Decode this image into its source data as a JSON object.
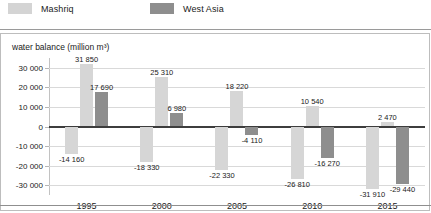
{
  "legend": {
    "items": [
      {
        "label": "Mashriq",
        "color": "#d6d6d6",
        "icon": "legend-swatch-icon"
      },
      {
        "label": "West Asia",
        "color": "#8e8e8e",
        "icon": "legend-swatch-icon"
      }
    ]
  },
  "axis": {
    "y_title": "water balance (million m³)",
    "y_ticks": [
      "30 000",
      "20 000",
      "10 000",
      "0",
      "-10 000",
      "-20 000",
      "-30 000"
    ]
  },
  "chart_data": {
    "type": "bar",
    "title": "",
    "subtitle": "",
    "xlabel": "",
    "ylabel": "water balance (million m³)",
    "ylim": [
      -35000,
      35000
    ],
    "ytick_values": [
      30000,
      20000,
      10000,
      0,
      -10000,
      -20000,
      -30000
    ],
    "grid": true,
    "legend_position": "top-left",
    "categories": [
      "1995",
      "2000",
      "2005",
      "2010",
      "2015"
    ],
    "series": [
      {
        "name": "Mashriq",
        "color": "#d6d6d6",
        "values": [
          -14160,
          -18330,
          -22330,
          -26810,
          -31910
        ],
        "labels": [
          "-14 160",
          "-18 330",
          "-22 330",
          "-26 810",
          "-31 910"
        ]
      },
      {
        "name": "Mashriq (second)",
        "color": "#d6d6d6",
        "values": [
          31850,
          25310,
          18220,
          10540,
          2470
        ],
        "labels": [
          "31 850",
          "25 310",
          "18 220",
          "10 540",
          "2 470"
        ]
      },
      {
        "name": "West Asia",
        "color": "#8e8e8e",
        "values": [
          17690,
          6980,
          -4110,
          -16270,
          -29440
        ],
        "labels": [
          "17 690",
          "6 980",
          "-4 110",
          "-16 270",
          "-29 440"
        ]
      }
    ]
  }
}
